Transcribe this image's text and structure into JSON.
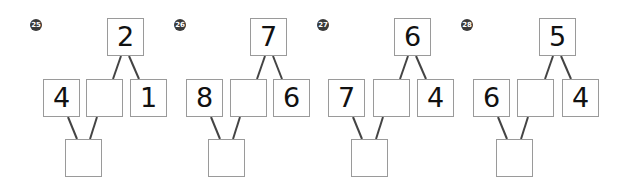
{
  "puzzles": [
    {
      "number": "25",
      "top": "2",
      "left": "4",
      "middle": "",
      "right": "1",
      "bottom": ""
    },
    {
      "number": "26",
      "top": "7",
      "left": "8",
      "middle": "",
      "right": "6",
      "bottom": ""
    },
    {
      "number": "27",
      "top": "6",
      "left": "7",
      "middle": "",
      "right": "4",
      "bottom": ""
    },
    {
      "number": "28",
      "top": "5",
      "left": "6",
      "middle": "",
      "right": "4",
      "bottom": ""
    }
  ],
  "colors": {
    "box_border": "#9a9a9a",
    "line": "#444444",
    "badge": "#3a3a3a",
    "text": "#111111"
  }
}
